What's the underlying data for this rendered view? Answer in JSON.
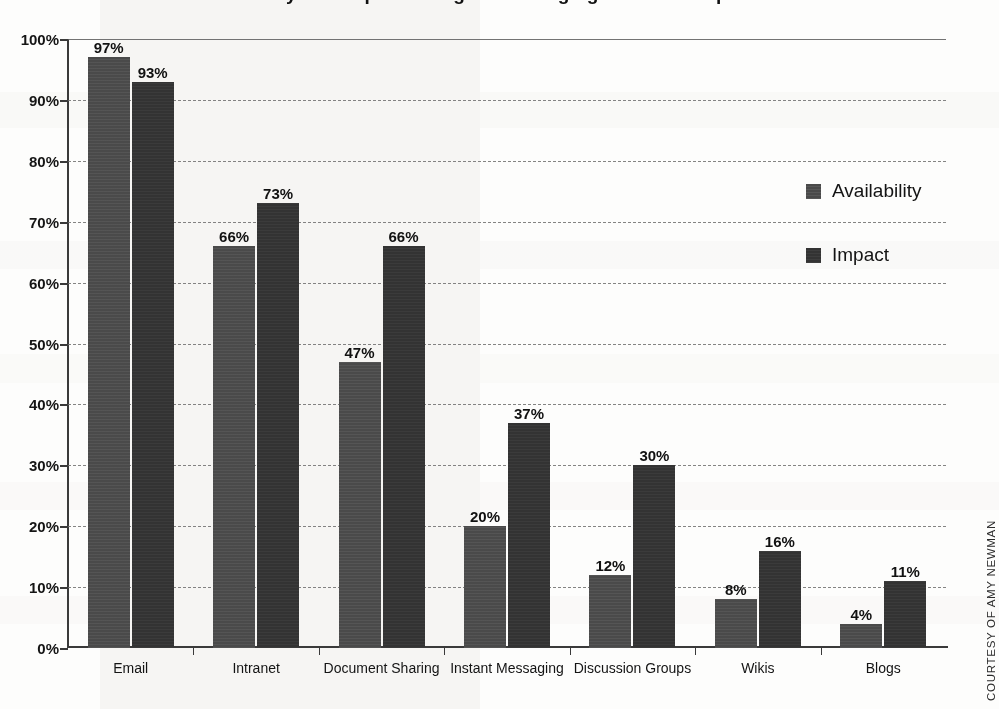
{
  "chart_data": {
    "type": "bar",
    "title": "Availability and Impact of Digital Messaging Tools in Corporations",
    "xlabel": "",
    "ylabel": "",
    "ylim": [
      0,
      100
    ],
    "y_ticks": [
      "0%",
      "10%",
      "20%",
      "30%",
      "40%",
      "50%",
      "60%",
      "70%",
      "80%",
      "90%",
      "100%"
    ],
    "y_tick_values": [
      0,
      10,
      20,
      30,
      40,
      50,
      60,
      70,
      80,
      90,
      100
    ],
    "grid": true,
    "legend_position": "right",
    "categories": [
      "Email",
      "Intranet",
      "Document Sharing",
      "Instant Messaging",
      "Discussion Groups",
      "Wikis",
      "Blogs"
    ],
    "series": [
      {
        "name": "Availability",
        "color": "#4a4a4a",
        "values": [
          97,
          66,
          47,
          20,
          12,
          8,
          4
        ],
        "labels": [
          "97%",
          "66%",
          "47%",
          "20%",
          "12%",
          "8%",
          "4%"
        ]
      },
      {
        "name": "Impact",
        "color": "#333333",
        "values": [
          93,
          73,
          66,
          37,
          30,
          16,
          11
        ],
        "labels": [
          "93%",
          "73%",
          "66%",
          "37%",
          "30%",
          "16%",
          "11%"
        ]
      }
    ]
  },
  "credit": {
    "text": "COURTESY OF AMY NEWMAN"
  }
}
